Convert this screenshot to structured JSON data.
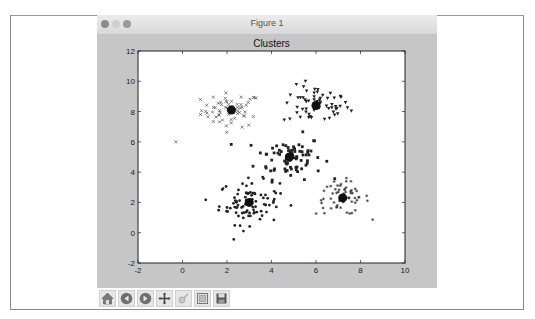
{
  "window": {
    "title": "Figure 1",
    "traffic_lights": [
      "close",
      "minimize",
      "maximize"
    ]
  },
  "toolbar": {
    "buttons": [
      {
        "name": "home",
        "icon": "home-icon"
      },
      {
        "name": "back",
        "icon": "back-arrow-icon"
      },
      {
        "name": "forward",
        "icon": "forward-arrow-icon"
      },
      {
        "name": "pan",
        "icon": "move-cross-icon"
      },
      {
        "name": "zoom",
        "icon": "zoom-rect-icon"
      },
      {
        "name": "configure-subplots",
        "icon": "subplots-icon"
      },
      {
        "name": "save",
        "icon": "floppy-disk-icon"
      }
    ]
  },
  "chart_data": {
    "type": "scatter",
    "title": "Clusters",
    "xlabel": "",
    "ylabel": "",
    "xlim": [
      -2,
      10
    ],
    "ylim": [
      -2,
      12
    ],
    "xticks": [
      "-2",
      "0",
      "2",
      "4",
      "6",
      "8",
      "10"
    ],
    "yticks": [
      "-2",
      "0",
      "2",
      "4",
      "6",
      "8",
      "10",
      "12"
    ],
    "grid": false,
    "legend": null,
    "colors": {
      "points": "#222222",
      "centers": "#111111",
      "background": "#ffffff",
      "figure_bg": "#c6c6c6"
    },
    "series": [
      {
        "name": "cluster-1",
        "marker": "x",
        "center": [
          2.2,
          8.1
        ],
        "spread": [
          0.9,
          0.7
        ],
        "n": 60
      },
      {
        "name": "cluster-2",
        "marker": "v",
        "center": [
          6.0,
          8.4
        ],
        "spread": [
          1.0,
          0.8
        ],
        "n": 60
      },
      {
        "name": "cluster-3",
        "marker": "s",
        "center": [
          4.8,
          5.0
        ],
        "spread": [
          1.0,
          0.9
        ],
        "n": 80
      },
      {
        "name": "cluster-4",
        "marker": "o",
        "center": [
          3.0,
          2.0
        ],
        "spread": [
          0.9,
          0.9
        ],
        "n": 90
      },
      {
        "name": "cluster-5",
        "marker": "*",
        "center": [
          7.2,
          2.3
        ],
        "spread": [
          0.8,
          0.7
        ],
        "n": 60
      }
    ],
    "centers": [
      [
        2.2,
        8.1
      ],
      [
        6.0,
        8.4
      ],
      [
        4.8,
        5.0
      ],
      [
        3.0,
        2.0
      ],
      [
        7.2,
        2.3
      ]
    ]
  }
}
